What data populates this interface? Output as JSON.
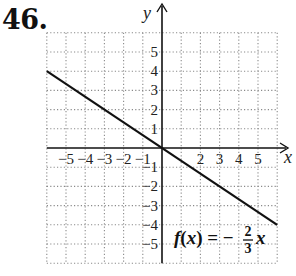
{
  "problem": {
    "number": "46."
  },
  "chart_data": {
    "type": "line",
    "title": "",
    "xlabel": "x",
    "ylabel": "y",
    "xlim": [
      -6,
      6
    ],
    "ylim": [
      -6,
      6
    ],
    "grid": true,
    "grid_style": "dotted",
    "x_ticks": [
      -5,
      -4,
      -3,
      -2,
      -1,
      2,
      3,
      4,
      5
    ],
    "x_tick_labels": [
      "−5",
      "−4",
      "−3",
      "−2",
      "−1",
      "2",
      "3",
      "4",
      "5"
    ],
    "y_ticks": [
      5,
      4,
      3,
      2,
      1,
      -1,
      -2,
      -3,
      -4,
      -5
    ],
    "y_tick_labels": [
      "5",
      "4",
      "3",
      "2",
      "1",
      "−1",
      "−2",
      "−3",
      "−4",
      "−5"
    ],
    "series": [
      {
        "name": "f(x) = −(2/3)x",
        "function": "-2/3*x",
        "x": [
          -6,
          6
        ],
        "y": [
          4,
          -4
        ],
        "color": "#111111"
      }
    ],
    "annotations": [
      {
        "text": "f(x) = −",
        "fraction_numerator": "2",
        "fraction_denominator": "3",
        "suffix": "x",
        "position": [
          1.0,
          -4.2
        ]
      }
    ],
    "legend": "none"
  },
  "colors": {
    "ink": "#111111",
    "grid": "#8a8a8a",
    "background": "#ffffff"
  }
}
